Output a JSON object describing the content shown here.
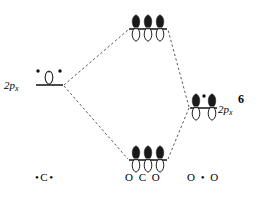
{
  "figure": {
    "number": "6",
    "type": "molecular-orbital-diagram",
    "width": 266,
    "height": 199,
    "background_color": "#ffffff",
    "ink_color": "#000000"
  },
  "levels": {
    "left_atomic": {
      "label_text": "2p",
      "label_sub": "x",
      "species_label": "•C•",
      "line": {
        "x1": 36,
        "x2": 63,
        "y": 85
      },
      "orbital_count": 1,
      "electron_dot_count": 2
    },
    "top_molecular": {
      "label_text": "",
      "species_label": "",
      "line": {
        "x1": 129,
        "x2": 167,
        "y": 29
      },
      "orbital_count": 3,
      "electron_dot_count": 0
    },
    "bottom_molecular": {
      "label_text": "",
      "species_label": "O C O",
      "line": {
        "x1": 129,
        "x2": 167,
        "y": 160
      },
      "orbital_count": 3,
      "electron_dot_count": 0
    },
    "right_atomic": {
      "label_text": "2p",
      "label_sub": "x",
      "species_label": "O • O",
      "line": {
        "x1": 190,
        "x2": 217,
        "y": 108
      },
      "orbital_count": 2,
      "electron_dot_count": 1
    }
  },
  "orbital_lobes": {
    "top_lobe_fill": "#1a1a1a",
    "bottom_lobe_fill": "#ffffff",
    "outline_color": "#1a1a1a"
  },
  "connectors": [
    {
      "name": "left-to-top",
      "x1": 64,
      "y1": 85,
      "x2": 128,
      "y2": 30
    },
    {
      "name": "left-to-bottom",
      "x1": 64,
      "y1": 86,
      "x2": 128,
      "y2": 159
    },
    {
      "name": "right-to-top",
      "x1": 189,
      "y1": 107,
      "x2": 168,
      "y2": 30
    },
    {
      "name": "right-to-bottom",
      "x1": 189,
      "y1": 108,
      "x2": 168,
      "y2": 159
    }
  ],
  "orbital_positions": {
    "left": [
      {
        "cx": 49,
        "base": 84
      }
    ],
    "top": [
      {
        "cx": 136,
        "base": 28
      },
      {
        "cx": 148,
        "base": 28
      },
      {
        "cx": 160,
        "base": 28
      }
    ],
    "bottom": [
      {
        "cx": 136,
        "base": 159
      },
      {
        "cx": 148,
        "base": 159
      },
      {
        "cx": 160,
        "base": 159
      }
    ],
    "right": [
      {
        "cx": 196,
        "base": 107
      },
      {
        "cx": 212,
        "base": 107
      }
    ]
  },
  "electron_dots": [
    {
      "name": "left-dot-1",
      "cx": 38,
      "cy": 71,
      "r": 1.7
    },
    {
      "name": "left-dot-2",
      "cx": 60,
      "cy": 71,
      "r": 1.7
    },
    {
      "name": "right-dot-1",
      "cx": 204,
      "cy": 96,
      "r": 1.7
    }
  ]
}
